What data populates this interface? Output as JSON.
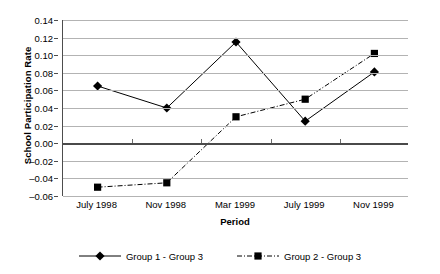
{
  "chart_data": {
    "type": "line",
    "title": "",
    "xlabel": "Period",
    "ylabel": "School Participation Rate",
    "categories": [
      "July 1998",
      "Nov 1998",
      "Mar 1999",
      "July 1999",
      "Nov 1999"
    ],
    "ylim": [
      -0.06,
      0.14
    ],
    "ytick_values": [
      0.14,
      0.12,
      0.1,
      0.08,
      0.06,
      0.04,
      0.02,
      0.0,
      -0.02,
      -0.04,
      -0.06
    ],
    "ytick_labels": [
      "0.14",
      "0.12",
      "0.10",
      "0.08",
      "0.06",
      "0.04",
      "0.02",
      "0.00",
      "–0.02",
      "–0.04",
      "–0.06"
    ],
    "grid": true,
    "legend_position": "bottom",
    "series": [
      {
        "name": "Group 1 - Group 3",
        "values": [
          0.065,
          0.04,
          0.115,
          0.025,
          0.081
        ],
        "marker": "diamond",
        "line_style": "solid",
        "color": "#000000"
      },
      {
        "name": "Group 2 - Group 3",
        "values": [
          -0.05,
          -0.045,
          0.03,
          0.05,
          0.102
        ],
        "marker": "square",
        "line_style": "dash-dot",
        "color": "#000000"
      }
    ]
  },
  "colors": {
    "grid": "#b3b3b3",
    "axis": "#4d4d4d",
    "zero_line": "#4a4a4a",
    "series_1": "#000000",
    "series_2": "#000000",
    "background": "#ffffff"
  }
}
